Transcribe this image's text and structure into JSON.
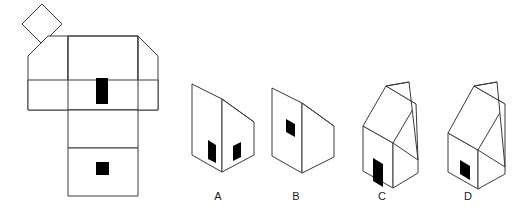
{
  "figure": {
    "type": "spatial-reasoning-net-and-solids",
    "background_color": "#ffffff",
    "line_color": "#3a3a3a",
    "aperture_color": "#000000",
    "label_color": "#1a1a1a",
    "net": {
      "name": "unfolded-net",
      "description": "Unfolded net of a house-shaped prism with a pitched roof",
      "faces": [
        {
          "name": "roof-panel-far",
          "shape": "square",
          "rotated": true,
          "points": "42,44 22,24 42,4 62,24",
          "aperture": null
        },
        {
          "name": "front-wall",
          "shape": "house-pentagon",
          "points": "28,56 48,36 68,56 68,110 28,110",
          "aperture": null
        },
        {
          "name": "center-wall",
          "shape": "rectangle",
          "points": "68,36 138,36 138,110 68,110",
          "aperture": {
            "name": "tall-door-aperture",
            "x": 96,
            "y": 78,
            "width": 12,
            "height": 26
          }
        },
        {
          "name": "roof-panel-near",
          "shape": "house-pentagon",
          "points": "138,36 158,56 158,110 138,110",
          "aperture": null
        },
        {
          "name": "side-wall-upper",
          "shape": "rectangle",
          "points": "68,110 138,110 138,148 68,148",
          "aperture": null
        },
        {
          "name": "side-wall-lower",
          "shape": "rectangle",
          "points": "68,148 138,148 138,196 68,196",
          "aperture": {
            "name": "square-window-aperture",
            "x": 96,
            "y": 162,
            "width": 13,
            "height": 13
          }
        }
      ]
    },
    "options": [
      {
        "id": "A",
        "label": "A",
        "name": "option-a",
        "description": "Flat-topped solid with slanted right top edge; tall aperture on front face and smaller slanted aperture on right face",
        "label_x": 218,
        "label_y": 200,
        "apertures": 2
      },
      {
        "id": "B",
        "label": "B",
        "name": "option-b",
        "description": "Flat-topped solid with slanted right top edge; single small aperture high on front face",
        "label_x": 296,
        "label_y": 200,
        "apertures": 1
      },
      {
        "id": "C",
        "label": "C",
        "name": "option-c",
        "description": "House solid with pitched roof; tall aperture low on front face near left edge",
        "label_x": 382,
        "label_y": 200,
        "apertures": 1
      },
      {
        "id": "D",
        "label": "D",
        "name": "option-d",
        "description": "House solid with single slanted roof; small aperture low on front face",
        "label_x": 468,
        "label_y": 200,
        "apertures": 1
      }
    ]
  }
}
